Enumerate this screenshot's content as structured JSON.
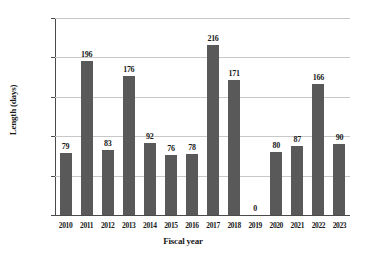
{
  "chart_data": {
    "type": "bar",
    "title": "",
    "xlabel": "Fiscal year",
    "ylabel": "Length (days)",
    "categories": [
      "2010",
      "2011",
      "2012",
      "2013",
      "2014",
      "2015",
      "2016",
      "2017",
      "2018",
      "2019",
      "2020",
      "2021",
      "2022",
      "2023"
    ],
    "values": [
      79,
      196,
      83,
      176,
      92,
      76,
      78,
      216,
      171,
      0,
      80,
      87,
      166,
      90
    ],
    "value_labels": [
      "79",
      "196",
      "83",
      "176",
      "92",
      "76",
      "78",
      "216",
      "171",
      "0",
      "80",
      "87",
      "166",
      "90"
    ],
    "ylim": [
      0,
      250
    ],
    "ytick_values": [
      0,
      50,
      100,
      150,
      200,
      250
    ],
    "ytick_labels": [
      "0",
      "50",
      "100",
      "150",
      "200",
      "250"
    ],
    "grid": "horizontal",
    "legend": "none",
    "series": [
      {
        "name": "Length (days)",
        "color": "#595959",
        "values": [
          79,
          196,
          83,
          176,
          92,
          76,
          78,
          216,
          171,
          0,
          80,
          87,
          166,
          90
        ]
      }
    ]
  },
  "style": {
    "background": "#ffffff",
    "bar_color": "#595959",
    "gridline_color": "#c8c8c8",
    "axis_color": "#4a4a4a",
    "text_color": "#1a1a1a"
  }
}
